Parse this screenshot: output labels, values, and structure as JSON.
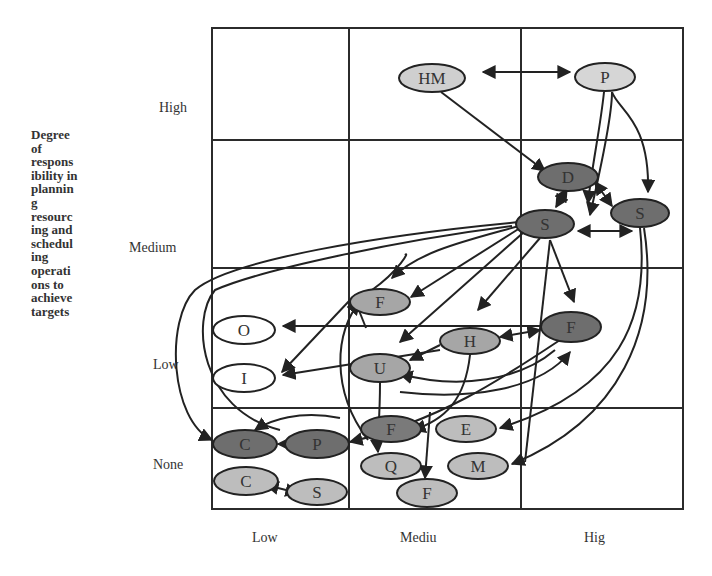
{
  "y_axis": {
    "title_lines": [
      "Degree",
      "of",
      "respons",
      "ibility in",
      "plannin",
      "g",
      "resourc",
      "ing and",
      "schedul",
      "ing",
      "operati",
      "ons to",
      "achieve",
      "targets"
    ],
    "ticks": [
      "High",
      "Medium",
      "Low",
      "None"
    ]
  },
  "x_axis": {
    "ticks": [
      "Low",
      "Mediu",
      "Hig"
    ]
  },
  "colors": {
    "grid": "#2b2b2b",
    "dark_node": "#6e6e6e",
    "medium_node": "#a6a6a6",
    "light_node": "#cfcfcf",
    "white_node": "#ffffff",
    "edge": "#222222"
  },
  "nodes": [
    {
      "id": "HM",
      "label": "HM",
      "fill": "light",
      "cx": 432,
      "cy": 78,
      "rx": 33,
      "ry": 14
    },
    {
      "id": "P_top",
      "label": "P",
      "fill": "light",
      "cx": 605,
      "cy": 77,
      "rx": 30,
      "ry": 14
    },
    {
      "id": "D",
      "label": "D",
      "fill": "dark",
      "cx": 568,
      "cy": 177,
      "rx": 30,
      "ry": 14
    },
    {
      "id": "S_mid",
      "label": "S",
      "fill": "dark",
      "cx": 545,
      "cy": 224,
      "rx": 29,
      "ry": 14
    },
    {
      "id": "S_right",
      "label": "S",
      "fill": "dark",
      "cx": 640,
      "cy": 213,
      "rx": 29,
      "ry": 14
    },
    {
      "id": "F_med",
      "label": "F",
      "fill": "medium",
      "cx": 380,
      "cy": 302,
      "rx": 30,
      "ry": 13
    },
    {
      "id": "O",
      "label": "O",
      "fill": "white",
      "cx": 244,
      "cy": 330,
      "rx": 31,
      "ry": 14
    },
    {
      "id": "I",
      "label": "I",
      "fill": "white",
      "cx": 244,
      "cy": 378,
      "rx": 31,
      "ry": 14
    },
    {
      "id": "H",
      "label": "H",
      "fill": "medium",
      "cx": 470,
      "cy": 341,
      "rx": 30,
      "ry": 13
    },
    {
      "id": "F_right",
      "label": "F",
      "fill": "dark",
      "cx": 571,
      "cy": 327,
      "rx": 30,
      "ry": 15
    },
    {
      "id": "U",
      "label": "U",
      "fill": "medium",
      "cx": 380,
      "cy": 368,
      "rx": 30,
      "ry": 14
    },
    {
      "id": "C_dark",
      "label": "C",
      "fill": "dark",
      "cx": 245,
      "cy": 444,
      "rx": 32,
      "ry": 14
    },
    {
      "id": "P_dark",
      "label": "P",
      "fill": "dark",
      "cx": 317,
      "cy": 444,
      "rx": 32,
      "ry": 14
    },
    {
      "id": "F_low1",
      "label": "F",
      "fill": "dark",
      "cx": 391,
      "cy": 429,
      "rx": 30,
      "ry": 13
    },
    {
      "id": "E",
      "label": "E",
      "fill": "light",
      "cx": 466,
      "cy": 429,
      "rx": 30,
      "ry": 13
    },
    {
      "id": "C_light",
      "label": "C",
      "fill": "light",
      "cx": 246,
      "cy": 481,
      "rx": 32,
      "ry": 14
    },
    {
      "id": "S_low",
      "label": "S",
      "fill": "light",
      "cx": 317,
      "cy": 492,
      "rx": 30,
      "ry": 13
    },
    {
      "id": "Q",
      "label": "Q",
      "fill": "light",
      "cx": 391,
      "cy": 466,
      "rx": 30,
      "ry": 13
    },
    {
      "id": "M",
      "label": "M",
      "fill": "light",
      "cx": 478,
      "cy": 466,
      "rx": 30,
      "ry": 13
    },
    {
      "id": "F_bottom",
      "label": "F",
      "fill": "light",
      "cx": 427,
      "cy": 493,
      "rx": 30,
      "ry": 14
    }
  ]
}
